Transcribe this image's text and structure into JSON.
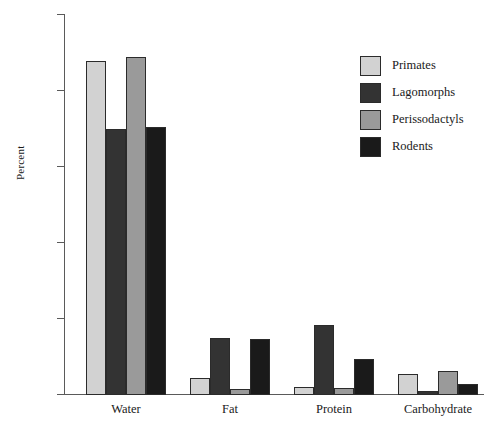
{
  "chart_data": {
    "type": "bar",
    "title": "",
    "xlabel": "",
    "ylabel": "Percent",
    "ylim": [
      0,
      100
    ],
    "yticks": [
      0,
      20,
      40,
      60,
      80,
      100
    ],
    "grid": false,
    "legend_position": "top-right",
    "categories": [
      "Water",
      "Fat",
      "Protein",
      "Carbohydrate"
    ],
    "series": [
      {
        "name": "Primates",
        "color": "#d2d2d2",
        "values": [
          88.0,
          4.5,
          2.0,
          5.5
        ]
      },
      {
        "name": "Lagomorphs",
        "color": "#333333",
        "values": [
          70.0,
          15.0,
          18.5,
          1.0
        ]
      },
      {
        "name": "Perissodactyls",
        "color": "#9a9a9a",
        "values": [
          89.0,
          1.5,
          1.8,
          6.2
        ]
      },
      {
        "name": "Rodents",
        "color": "#1a1a1a",
        "values": [
          70.5,
          14.8,
          9.5,
          2.8
        ]
      }
    ]
  },
  "axis": {
    "y_title": "Percent",
    "tick_labels": [
      "0",
      "20",
      "40",
      "60",
      "80",
      "100"
    ]
  },
  "legend": {
    "items": [
      {
        "label": "Primates"
      },
      {
        "label": "Lagomorphs"
      },
      {
        "label": "Perissodactyls"
      },
      {
        "label": "Rodents"
      }
    ]
  }
}
